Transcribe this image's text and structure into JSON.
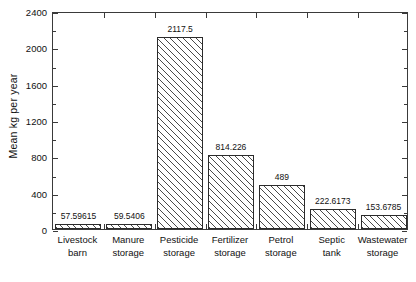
{
  "chart_data": {
    "type": "bar",
    "title": "",
    "xlabel": "",
    "ylabel": "Mean kg per year",
    "ylim": [
      0,
      2400
    ],
    "ytick_step": 400,
    "yticks": [
      "0",
      "400",
      "800",
      "1200",
      "1600",
      "2000",
      "2400"
    ],
    "minor_ticks": true,
    "grid": false,
    "legend": null,
    "bar_fill": "diagonal-hatch",
    "bar_edge_color": "#2b2b2b",
    "background_color": "#ffffff",
    "categories": [
      "Livestock barn",
      "Manure storage",
      "Pesticide storage",
      "Fertilizer storage",
      "Petrol storage",
      "Septic tank",
      "Wastewater storage"
    ],
    "category_lines": [
      [
        "Livestock",
        "barn"
      ],
      [
        "Manure",
        "storage"
      ],
      [
        "Pesticide",
        "storage"
      ],
      [
        "Fertilizer",
        "storage"
      ],
      [
        "Petrol",
        "storage"
      ],
      [
        "Septic",
        "tank"
      ],
      [
        "Wastewater",
        "storage"
      ]
    ],
    "values": [
      57.59615,
      59.5406,
      2117.5,
      814.226,
      489,
      222.6173,
      153.6785
    ],
    "value_labels": [
      "57.59615",
      "59.5406",
      "2117.5",
      "814.226",
      "489",
      "222.6173",
      "153.6785"
    ]
  }
}
